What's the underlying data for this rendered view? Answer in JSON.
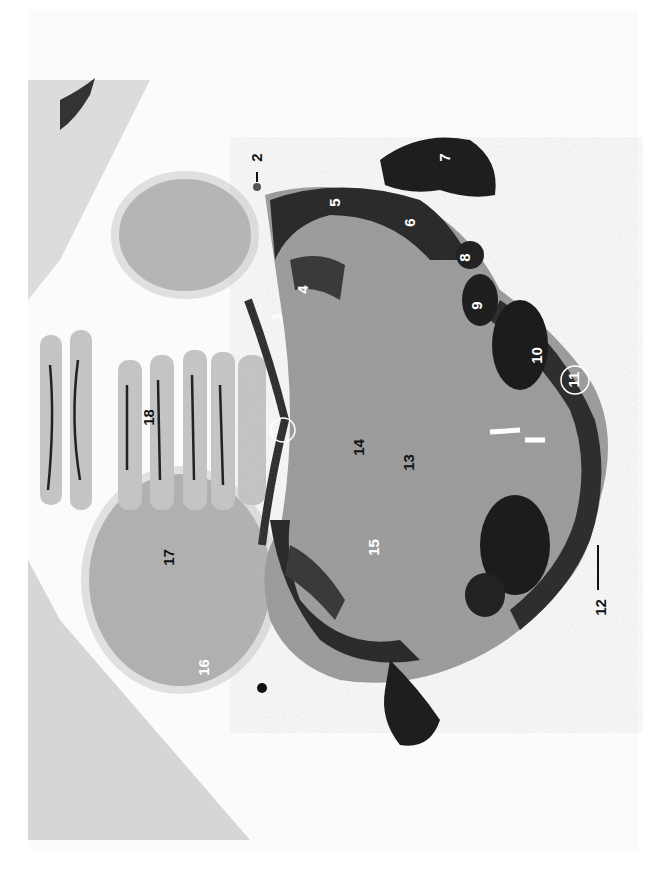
{
  "figure": {
    "type": "histological brain section micrograph (rotated 90°)",
    "background_color": "#ffffff",
    "tissue_dark_color": "#2a2a2a",
    "tissue_mid_color": "#8a8a8a",
    "tissue_light_color": "#c8c8c8"
  },
  "labels": [
    {
      "id": "2",
      "text": "2"
    },
    {
      "id": "3",
      "text": "3"
    },
    {
      "id": "4",
      "text": "4"
    },
    {
      "id": "5",
      "text": "5"
    },
    {
      "id": "6",
      "text": "6"
    },
    {
      "id": "7",
      "text": "7"
    },
    {
      "id": "8",
      "text": "8"
    },
    {
      "id": "9",
      "text": "9"
    },
    {
      "id": "10",
      "text": "10"
    },
    {
      "id": "11",
      "text": "11"
    },
    {
      "id": "12",
      "text": "12"
    },
    {
      "id": "13",
      "text": "13"
    },
    {
      "id": "14",
      "text": "14"
    },
    {
      "id": "15",
      "text": "15"
    },
    {
      "id": "16",
      "text": "16"
    },
    {
      "id": "17",
      "text": "17"
    },
    {
      "id": "18",
      "text": "18"
    }
  ]
}
